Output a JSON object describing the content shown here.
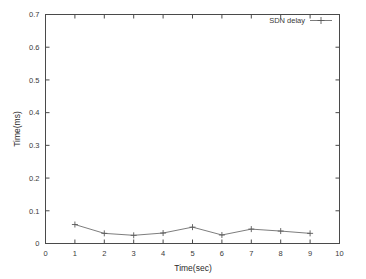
{
  "chart_data": {
    "type": "line",
    "title": "",
    "xlabel": "Time(sec)",
    "ylabel": "Time(ms)",
    "xlim": [
      0,
      10
    ],
    "ylim": [
      0,
      0.7
    ],
    "grid": false,
    "legend_position": "top-right",
    "x_ticks": [
      "0",
      "1",
      "2",
      "3",
      "4",
      "5",
      "6",
      "7",
      "8",
      "9",
      "10"
    ],
    "x_tick_values": [
      0,
      1,
      2,
      3,
      4,
      5,
      6,
      7,
      8,
      9,
      10
    ],
    "y_ticks": [
      "0",
      "0.1",
      "0.2",
      "0.3",
      "0.4",
      "0.5",
      "0.6",
      "0.7"
    ],
    "y_tick_values": [
      0,
      0.1,
      0.2,
      0.3,
      0.4,
      0.5,
      0.6,
      0.7
    ],
    "x": [
      1,
      2,
      3,
      4,
      5,
      6,
      7,
      8,
      9
    ],
    "series": [
      {
        "name": "SDN delay",
        "marker": "plus",
        "color": "#6e6e6e",
        "values": [
          0.058,
          0.031,
          0.025,
          0.032,
          0.05,
          0.026,
          0.044,
          0.038,
          0.031
        ]
      }
    ]
  },
  "legend": {
    "entries": [
      {
        "label": "SDN delay"
      }
    ]
  },
  "axes": {
    "x_axis_label": "Time(sec)",
    "y_axis_label": "Time(ms)"
  }
}
